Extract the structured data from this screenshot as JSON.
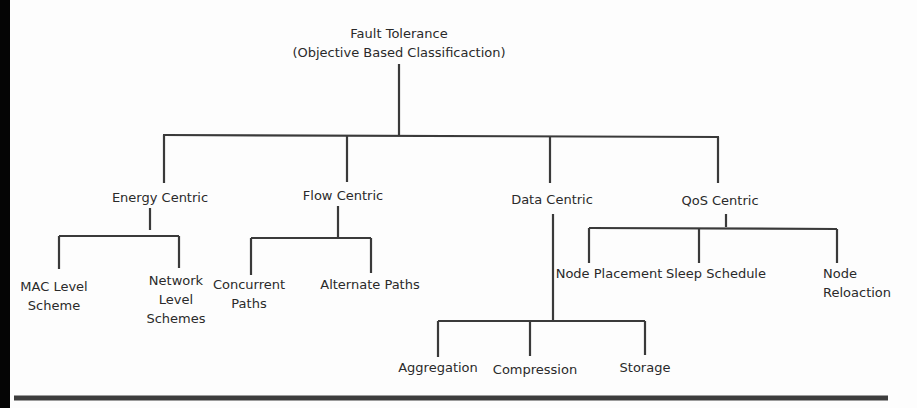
{
  "diagram": {
    "type": "hierarchy-tree",
    "root": {
      "line1": "Fault Tolerance",
      "line2": "(Objective Based Classificaction)"
    },
    "categories": [
      {
        "label": "Energy Centric",
        "children": [
          {
            "lines": [
              "MAC Level",
              "Scheme"
            ]
          },
          {
            "lines": [
              "Network",
              "Level",
              "Schemes"
            ]
          }
        ]
      },
      {
        "label": "Flow Centric",
        "children": [
          {
            "lines": [
              "Concurrent",
              "Paths"
            ]
          },
          {
            "lines": [
              "Alternate Paths"
            ]
          }
        ]
      },
      {
        "label": "Data Centric",
        "children": [
          {
            "lines": [
              "Aggregation"
            ]
          },
          {
            "lines": [
              "Compression"
            ]
          },
          {
            "lines": [
              "Storage"
            ]
          }
        ]
      },
      {
        "label": "QoS Centric",
        "children": [
          {
            "lines": [
              "Node Placement"
            ]
          },
          {
            "lines": [
              "Sleep Schedule"
            ]
          },
          {
            "lines": [
              "Node",
              "Reloaction"
            ]
          }
        ]
      }
    ],
    "colors": {
      "text": "#2a2a2a",
      "lines": "#3a3a3a",
      "background": "#fdfdfd",
      "left_edge": "#050505"
    }
  }
}
